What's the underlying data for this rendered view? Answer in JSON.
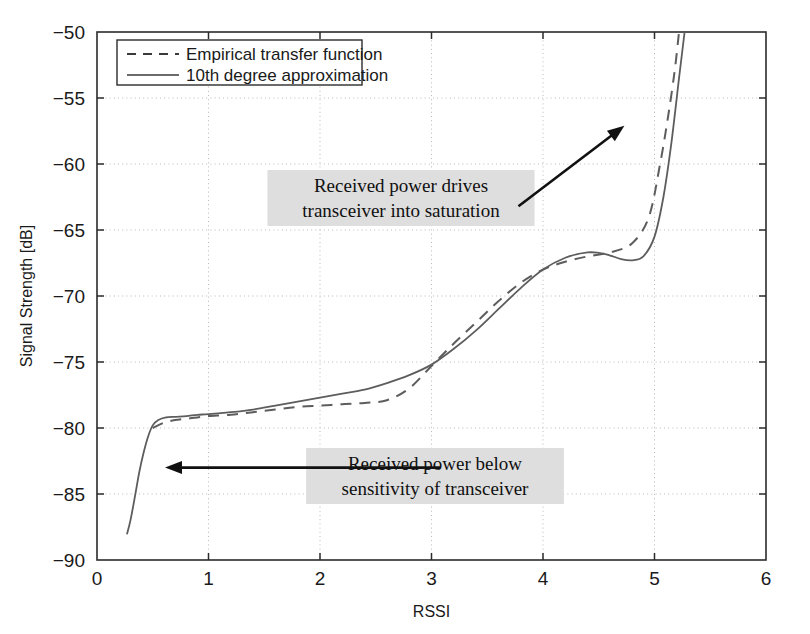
{
  "chart_data": {
    "type": "line",
    "title": "",
    "xlabel": "RSSI",
    "ylabel": "Signal Strength [dB]",
    "xlim": [
      0,
      6
    ],
    "ylim": [
      -90,
      -50
    ],
    "xticks": [
      "0",
      "1",
      "2",
      "3",
      "4",
      "5",
      "6"
    ],
    "yticks": [
      "-90",
      "-85",
      "-80",
      "-75",
      "-70",
      "-65",
      "-60",
      "-55",
      "-50"
    ],
    "grid": true,
    "legend_position": "upper-left",
    "series": [
      {
        "name": "Empirical transfer function",
        "style": "dashed",
        "color": "#5d5d5d",
        "x": [
          0.5,
          0.6,
          0.7,
          0.8,
          0.9,
          1.0,
          1.2,
          1.4,
          1.6,
          1.8,
          2.0,
          2.2,
          2.4,
          2.6,
          2.8,
          3.0,
          3.2,
          3.4,
          3.6,
          3.8,
          4.0,
          4.2,
          4.4,
          4.6,
          4.8,
          4.95,
          5.05,
          5.12,
          5.18,
          5.22
        ],
        "y": [
          -80.0,
          -79.6,
          -79.4,
          -79.3,
          -79.2,
          -79.1,
          -79.0,
          -78.8,
          -78.6,
          -78.4,
          -78.3,
          -78.2,
          -78.1,
          -77.9,
          -77.0,
          -75.3,
          -73.6,
          -72.0,
          -70.4,
          -69.0,
          -68.0,
          -67.4,
          -67.0,
          -66.7,
          -66.0,
          -64.0,
          -60.0,
          -56.5,
          -53.0,
          -50.0
        ]
      },
      {
        "name": "10th degree approximation",
        "style": "solid",
        "color": "#5d5d5d",
        "x": [
          0.27,
          0.3,
          0.34,
          0.38,
          0.42,
          0.46,
          0.5,
          0.55,
          0.62,
          0.7,
          0.8,
          0.9,
          1.0,
          1.2,
          1.4,
          1.6,
          1.8,
          2.0,
          2.2,
          2.4,
          2.6,
          2.8,
          3.0,
          3.2,
          3.4,
          3.6,
          3.8,
          4.0,
          4.2,
          4.4,
          4.55,
          4.7,
          4.8,
          4.9,
          5.0,
          5.08,
          5.15,
          5.22,
          5.27
        ],
        "y": [
          -88.0,
          -87.0,
          -85.2,
          -83.3,
          -81.8,
          -80.6,
          -79.8,
          -79.4,
          -79.2,
          -79.15,
          -79.1,
          -79.0,
          -78.95,
          -78.8,
          -78.6,
          -78.3,
          -78.0,
          -77.7,
          -77.4,
          -77.1,
          -76.6,
          -76.0,
          -75.2,
          -74.0,
          -72.6,
          -71.0,
          -69.4,
          -68.0,
          -67.1,
          -66.7,
          -66.8,
          -67.2,
          -67.3,
          -67.0,
          -65.5,
          -62.5,
          -58.5,
          -53.5,
          -50.0
        ]
      }
    ],
    "annotations": [
      {
        "id": "saturation-note",
        "lines": [
          "Received power drives",
          "transceiver into saturation"
        ],
        "arrow_from": [
          3.78,
          -63.2
        ],
        "arrow_to": [
          4.73,
          -57.1
        ]
      },
      {
        "id": "sensitivity-note",
        "lines": [
          "Received power below",
          "sensitivity of transceiver"
        ],
        "arrow_from": [
          3.08,
          -83.0
        ],
        "arrow_to": [
          0.61,
          -83.0
        ]
      }
    ]
  },
  "colors": {
    "curve": "#5d5d5d",
    "axis": "#2b2b2b",
    "grid": "#b9b9b9",
    "annotation_bg": "#dedede",
    "arrow": "#111111"
  }
}
